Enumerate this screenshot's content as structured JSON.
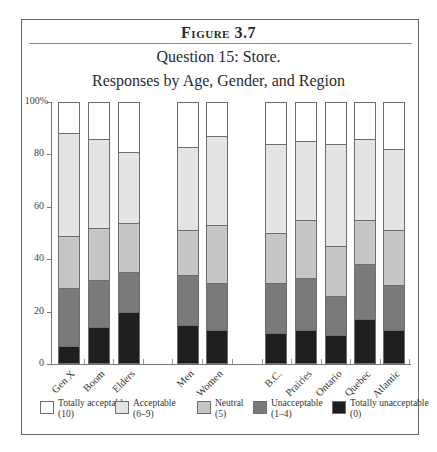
{
  "figure": {
    "label": "Figure 3.7",
    "title_line1": "Question 15: Store.",
    "title_line2": "Responses by Age, Gender, and Region"
  },
  "colors": {
    "totally_acceptable": "#ffffff",
    "acceptable": "#e4e4e4",
    "neutral": "#c6c6c6",
    "unacceptable": "#7a7a7a",
    "totally_unacceptable": "#1e1e1e"
  },
  "legend": [
    {
      "key": "totally_acceptable",
      "label": "Totally acceptable",
      "sub": "(10)",
      "color": "#ffffff"
    },
    {
      "key": "acceptable",
      "label": "Acceptable",
      "sub": "(6–9)",
      "color": "#e4e4e4"
    },
    {
      "key": "neutral",
      "label": "Neutral",
      "sub": "(5)",
      "color": "#c6c6c6"
    },
    {
      "key": "unacceptable",
      "label": "Unacceptable",
      "sub": "(1–4)",
      "color": "#7a7a7a"
    },
    {
      "key": "totally_unacceptable",
      "label": "Totally unacceptable",
      "sub": "(0)",
      "color": "#1e1e1e"
    }
  ],
  "yaxis": {
    "ticks": [
      "0",
      "20",
      "40",
      "60",
      "80",
      "100%"
    ]
  },
  "chart_data": {
    "type": "bar",
    "stacked": true,
    "percent": true,
    "xlabel": "",
    "ylabel": "",
    "ylim": [
      0,
      100
    ],
    "yticks": [
      0,
      20,
      40,
      60,
      80,
      100
    ],
    "grid": false,
    "legend_position": "bottom",
    "groups": [
      {
        "name": "Age",
        "categories": [
          "Gen X",
          "Boom",
          "Elders"
        ]
      },
      {
        "name": "Gender",
        "categories": [
          "Men",
          "Women"
        ]
      },
      {
        "name": "Region",
        "categories": [
          "B.C.",
          "Prairies",
          "Ontario",
          "Quebec",
          "Atlantic"
        ]
      }
    ],
    "categories": [
      "Gen X",
      "Boom",
      "Elders",
      "Men",
      "Women",
      "B.C.",
      "Prairies",
      "Ontario",
      "Quebec",
      "Atlantic"
    ],
    "series": [
      {
        "name": "Totally unacceptable (0)",
        "values": [
          7,
          14,
          20,
          15,
          13,
          12,
          13,
          11,
          17,
          13
        ]
      },
      {
        "name": "Unacceptable (1–4)",
        "values": [
          22,
          18,
          15,
          19,
          18,
          19,
          20,
          15,
          21,
          17
        ]
      },
      {
        "name": "Neutral (5)",
        "values": [
          20,
          20,
          19,
          17,
          22,
          19,
          22,
          19,
          17,
          21
        ]
      },
      {
        "name": "Acceptable (6–9)",
        "values": [
          39,
          34,
          27,
          32,
          34,
          34,
          30,
          39,
          31,
          31
        ]
      },
      {
        "name": "Totally acceptable (10)",
        "values": [
          12,
          14,
          19,
          17,
          13,
          16,
          15,
          16,
          14,
          18
        ]
      }
    ]
  }
}
